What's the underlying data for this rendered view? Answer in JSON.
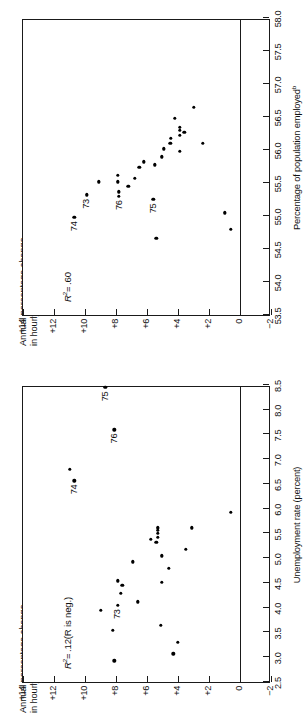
{
  "figure": {
    "panels": [
      {
        "id": "unemployment",
        "chart_data": {
          "type": "scatter",
          "title": "",
          "xlabel": "Unemployment rate (percent)",
          "ylabel": "Annual percentage change\nin hourly compensation rate",
          "ylabel_sup": "a",
          "xlabel_sup": "",
          "xlim": [
            2.5,
            8.5
          ],
          "ylim": [
            -2,
            14
          ],
          "xticks": [
            2.5,
            3.0,
            3.5,
            4.0,
            4.5,
            5.0,
            5.5,
            6.0,
            6.5,
            7.0,
            7.5,
            8.0,
            8.5
          ],
          "xticklabels": [
            "2.5",
            "3.0",
            "3.5",
            "4.0",
            "4.5",
            "5.0",
            "5.5",
            "6.0",
            "6.5",
            "7.0",
            "7.5",
            "8.0",
            "8.5"
          ],
          "yticks": [
            -2,
            0,
            2,
            4,
            6,
            8,
            10,
            12,
            14
          ],
          "yticklabels": [
            "−2",
            "0",
            "+2",
            "+4",
            "+6",
            "+8",
            "+10",
            "+12",
            "+14"
          ],
          "grid": false,
          "zero_line": 0,
          "annotation": "R²= .12(R is neg.)",
          "annotation_parts": {
            "lead": "R",
            "sup": "2",
            "rest": "= .12(R is neg.)"
          },
          "points": [
            {
              "x": 2.93,
              "y": 8.1,
              "label": ""
            },
            {
              "x": 3.55,
              "y": 8.2,
              "label": ""
            },
            {
              "x": 3.95,
              "y": 9.0,
              "label": ""
            },
            {
              "x": 4.3,
              "y": 7.7,
              "label": ""
            },
            {
              "x": 4.45,
              "y": 7.6,
              "label": ""
            },
            {
              "x": 4.93,
              "y": 6.9,
              "label": ""
            },
            {
              "x": 5.32,
              "y": 5.4,
              "label": ""
            },
            {
              "x": 5.42,
              "y": 5.3,
              "label": ""
            },
            {
              "x": 5.5,
              "y": 5.3,
              "label": ""
            },
            {
              "x": 5.57,
              "y": 5.3,
              "label": ""
            },
            {
              "x": 5.62,
              "y": 5.3,
              "label": ""
            },
            {
              "x": 5.38,
              "y": 5.75,
              "label": ""
            },
            {
              "x": 5.93,
              "y": 0.6,
              "label": ""
            },
            {
              "x": 6.57,
              "y": 10.7,
              "label": "74"
            },
            {
              "x": 6.8,
              "y": 11.0,
              "label": ""
            },
            {
              "x": 3.07,
              "y": 4.3,
              "label": ""
            },
            {
              "x": 3.3,
              "y": 4.0,
              "label": ""
            },
            {
              "x": 3.65,
              "y": 5.1,
              "label": ""
            },
            {
              "x": 4.12,
              "y": 6.6,
              "label": ""
            },
            {
              "x": 4.52,
              "y": 5.05,
              "label": ""
            },
            {
              "x": 4.8,
              "y": 4.6,
              "label": ""
            },
            {
              "x": 5.05,
              "y": 5.05,
              "label": ""
            },
            {
              "x": 5.18,
              "y": 3.5,
              "label": ""
            },
            {
              "x": 5.62,
              "y": 3.1,
              "label": ""
            },
            {
              "x": 4.05,
              "y": 7.9,
              "label": "73"
            },
            {
              "x": 4.55,
              "y": 7.9,
              "label": ""
            },
            {
              "x": 7.6,
              "y": 8.1,
              "label": "76"
            },
            {
              "x": 8.45,
              "y": 8.7,
              "label": "75"
            }
          ]
        }
      },
      {
        "id": "employment",
        "chart_data": {
          "type": "scatter",
          "title": "",
          "xlabel": "Percentage of population employed",
          "xlabel_sup": "b",
          "ylabel": "Annual percentage change\nin hourly compensation",
          "ylabel_sup": "a",
          "xlim": [
            53.5,
            58.0
          ],
          "ylim": [
            -2,
            14
          ],
          "xticks": [
            53.5,
            54.0,
            54.5,
            55.0,
            55.5,
            56.0,
            56.5,
            57.0,
            57.5,
            58.0
          ],
          "xticklabels": [
            "53.5",
            "54.0",
            "54.5",
            "55.0",
            "55.5",
            "56.0",
            "56.5",
            "57.0",
            "57.5",
            "58.0"
          ],
          "yticks": [
            -2,
            0,
            2,
            4,
            6,
            8,
            10,
            12,
            14
          ],
          "yticklabels": [
            "−2",
            "0",
            "+2",
            "+4",
            "+6",
            "+8",
            "+10",
            "+12",
            "+14"
          ],
          "grid": false,
          "zero_line": 0,
          "annotation": "R²= .60",
          "annotation_parts": {
            "lead": "R",
            "sup": "2",
            "rest": "= .60"
          },
          "points": [
            {
              "x": 54.98,
              "y": 10.7,
              "label": "74"
            },
            {
              "x": 55.32,
              "y": 9.9,
              "label": "73"
            },
            {
              "x": 55.52,
              "y": 9.1,
              "label": ""
            },
            {
              "x": 55.3,
              "y": 7.8,
              "label": "76"
            },
            {
              "x": 55.37,
              "y": 7.8,
              "label": ""
            },
            {
              "x": 55.52,
              "y": 7.9,
              "label": ""
            },
            {
              "x": 55.62,
              "y": 7.9,
              "label": ""
            },
            {
              "x": 55.45,
              "y": 7.2,
              "label": ""
            },
            {
              "x": 55.57,
              "y": 6.8,
              "label": ""
            },
            {
              "x": 55.74,
              "y": 6.5,
              "label": ""
            },
            {
              "x": 55.82,
              "y": 6.2,
              "label": ""
            },
            {
              "x": 55.25,
              "y": 5.6,
              "label": "75"
            },
            {
              "x": 54.66,
              "y": 5.4,
              "label": ""
            },
            {
              "x": 55.78,
              "y": 5.5,
              "label": ""
            },
            {
              "x": 55.9,
              "y": 5.05,
              "label": ""
            },
            {
              "x": 56.02,
              "y": 4.9,
              "label": ""
            },
            {
              "x": 56.1,
              "y": 4.5,
              "label": ""
            },
            {
              "x": 56.18,
              "y": 4.45,
              "label": ""
            },
            {
              "x": 55.98,
              "y": 3.9,
              "label": ""
            },
            {
              "x": 56.22,
              "y": 3.9,
              "label": ""
            },
            {
              "x": 56.3,
              "y": 3.9,
              "label": ""
            },
            {
              "x": 56.35,
              "y": 3.9,
              "label": ""
            },
            {
              "x": 56.27,
              "y": 3.6,
              "label": ""
            },
            {
              "x": 56.48,
              "y": 4.2,
              "label": ""
            },
            {
              "x": 56.65,
              "y": 3.0,
              "label": ""
            },
            {
              "x": 56.1,
              "y": 2.4,
              "label": ""
            },
            {
              "x": 54.8,
              "y": 0.6,
              "label": ""
            },
            {
              "x": 55.05,
              "y": 1.0,
              "label": ""
            }
          ]
        }
      }
    ]
  }
}
